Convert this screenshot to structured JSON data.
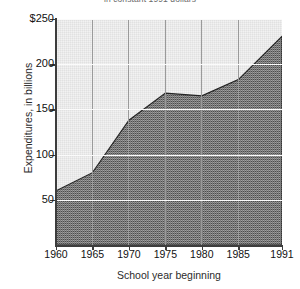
{
  "chart_data": {
    "type": "area",
    "title": "in constant 1991 dollars",
    "xlabel": "School year beginning",
    "ylabel": "Expenditures, in billions",
    "x": [
      1960,
      1965,
      1970,
      1975,
      1980,
      1985,
      1991
    ],
    "values": [
      60,
      80,
      138,
      168,
      165,
      183,
      231
    ],
    "series": [
      {
        "name": "Expenditures",
        "values": [
          60,
          80,
          138,
          168,
          165,
          183,
          231
        ]
      }
    ],
    "xlim": [
      1960,
      1991
    ],
    "ylim": [
      0,
      250
    ],
    "ytick_labels": [
      "$250",
      "200",
      "150",
      "100",
      "50"
    ],
    "ytick_values": [
      250,
      200,
      150,
      100,
      50
    ],
    "xtick_labels": [
      "1960",
      "1965",
      "1970",
      "1975",
      "1980",
      "1985",
      "1991"
    ],
    "xtick_values": [
      1960,
      1965,
      1970,
      1975,
      1980,
      1985,
      1991
    ],
    "grid": "vertical gridlines at each x tick, faint horizontal gridlines at y ticks",
    "legend": "none",
    "fill_color": "#555555",
    "plot_background": "#f2f2f2",
    "axis_color": "#3d3d3d"
  },
  "axes": {
    "y_ticks": [
      {
        "label": "$250",
        "value": 250
      },
      {
        "label": "200",
        "value": 200
      },
      {
        "label": "150",
        "value": 150
      },
      {
        "label": "100",
        "value": 100
      },
      {
        "label": "50",
        "value": 50
      }
    ],
    "x_ticks": [
      {
        "label": "1960",
        "value": 1960
      },
      {
        "label": "1965",
        "value": 1965
      },
      {
        "label": "1970",
        "value": 1970
      },
      {
        "label": "1975",
        "value": 1975
      },
      {
        "label": "1980",
        "value": 1980
      },
      {
        "label": "1985",
        "value": 1985
      },
      {
        "label": "1991",
        "value": 1991
      }
    ]
  }
}
